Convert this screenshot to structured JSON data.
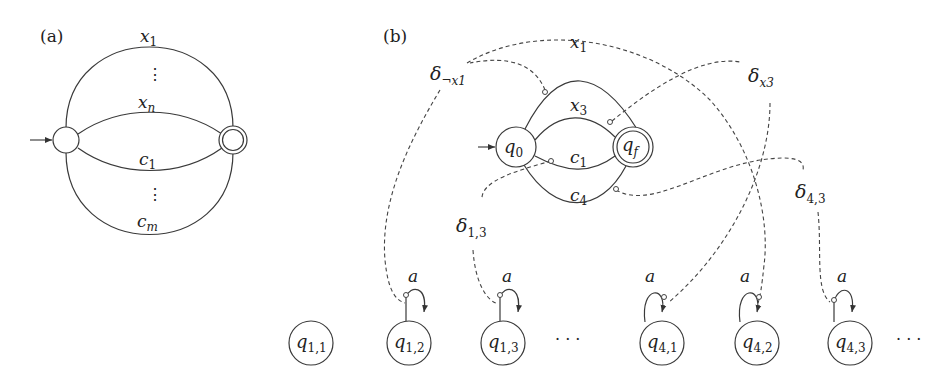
{
  "panel_a": {
    "label": "(a)",
    "edges_top": [
      {
        "base": "x",
        "sub": "1"
      },
      {
        "base": "x",
        "sub": "n"
      }
    ],
    "edges_bottom": [
      {
        "base": "c",
        "sub": "1"
      },
      {
        "base": "c",
        "sub": "m"
      }
    ],
    "vdots": "⋮"
  },
  "panel_b": {
    "label": "(b)",
    "q0": {
      "base": "q",
      "sub": "0"
    },
    "qf": {
      "base": "q",
      "sub": "f"
    },
    "edges": [
      {
        "base": "x",
        "sub": "1"
      },
      {
        "base": "x",
        "sub": "3"
      },
      {
        "base": "c",
        "sub": "1"
      },
      {
        "base": "c",
        "sub": "4"
      }
    ],
    "deltas": [
      {
        "base": "δ",
        "sub": "¬x1"
      },
      {
        "base": "δ",
        "sub": "x3"
      },
      {
        "base": "δ",
        "sub": "1,3"
      },
      {
        "base": "δ",
        "sub": "4,3"
      }
    ],
    "bottom_nodes": [
      {
        "base": "q",
        "sub": "1,1"
      },
      {
        "base": "q",
        "sub": "1,2"
      },
      {
        "base": "q",
        "sub": "1,3"
      },
      {
        "base": "q",
        "sub": "4,1"
      },
      {
        "base": "q",
        "sub": "4,2"
      },
      {
        "base": "q",
        "sub": "4,3"
      }
    ],
    "loop_label": "a",
    "ellipsis": "· · ·"
  }
}
